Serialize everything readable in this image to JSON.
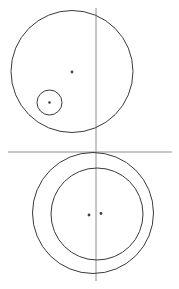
{
  "figure": {
    "background_color": "#ffffff",
    "width": 179,
    "height": 289,
    "stroke_color_circle": "#3a3a3a",
    "stroke_color_axis": "#8e8e8e",
    "dot_color": "#404040",
    "axes": [
      {
        "name": "vertical-axis",
        "orientation": "vertical",
        "x": 96,
        "y1": 8,
        "y2": 281,
        "color": "#8e8e8e"
      },
      {
        "name": "horizontal-axis",
        "orientation": "horizontal",
        "y": 152,
        "x1": 8,
        "x2": 172,
        "color": "#8e8e8e"
      }
    ],
    "circles": [
      {
        "name": "upper-large-circle",
        "cx": 72,
        "cy": 71.5,
        "r": 61,
        "color": "#3a3a3a"
      },
      {
        "name": "upper-small-circle",
        "cx": 49.5,
        "cy": 102.5,
        "r": 12.5,
        "color": "#3a3a3a"
      },
      {
        "name": "lower-outer-circle",
        "cx": 93,
        "cy": 213,
        "r": 60.5,
        "color": "#3a3a3a"
      },
      {
        "name": "lower-inner-circle",
        "cx": 97,
        "cy": 214,
        "r": 46,
        "color": "#3a3a3a"
      }
    ],
    "dots": [
      {
        "name": "upper-large-circle-center-dot",
        "cx": 72,
        "cy": 72,
        "r": 1.4,
        "color": "#404040"
      },
      {
        "name": "upper-small-circle-center-dot",
        "cx": 49.5,
        "cy": 102.5,
        "r": 1.3,
        "color": "#404040"
      },
      {
        "name": "lower-outer-circle-center-dot",
        "cx": 89,
        "cy": 215,
        "r": 1.4,
        "color": "#404040"
      },
      {
        "name": "lower-inner-circle-center-dot",
        "cx": 101,
        "cy": 213.5,
        "r": 1.4,
        "color": "#404040"
      }
    ]
  }
}
